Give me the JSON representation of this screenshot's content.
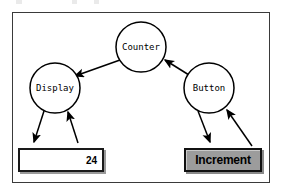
{
  "diagram": {
    "type": "node-link-dataflow",
    "nodes": [
      {
        "id": "counter",
        "label": "Counter",
        "shape": "circle",
        "cx": 141,
        "cy": 47,
        "r": 25
      },
      {
        "id": "display",
        "label": "Display",
        "shape": "circle",
        "cx": 55,
        "cy": 88,
        "r": 25
      },
      {
        "id": "button",
        "label": "Button",
        "shape": "circle",
        "cx": 209,
        "cy": 88,
        "r": 25
      }
    ],
    "edges": [
      {
        "from": "counter",
        "to": "display",
        "arrow": "to"
      },
      {
        "from": "button",
        "to": "counter",
        "arrow": "to"
      },
      {
        "from": "display",
        "to": "display-field",
        "arrow": "to"
      },
      {
        "from": "display-field",
        "to": "display",
        "arrow": "to"
      },
      {
        "from": "button",
        "to": "increment-button",
        "arrow": "to"
      },
      {
        "from": "increment-button",
        "to": "button",
        "arrow": "to"
      }
    ]
  },
  "widgets": {
    "display_field": {
      "value": "24",
      "placeholder": ""
    },
    "increment_button": {
      "label": "Increment"
    }
  },
  "colors": {
    "frame_border": "#3a3a3a",
    "canvas_background": "#ffffff",
    "stroke": "#000000",
    "button_face": "#9c9c9c",
    "bevel_shadow": "#9a9a9a",
    "field_background": "#ffffff",
    "text": "#000000"
  }
}
